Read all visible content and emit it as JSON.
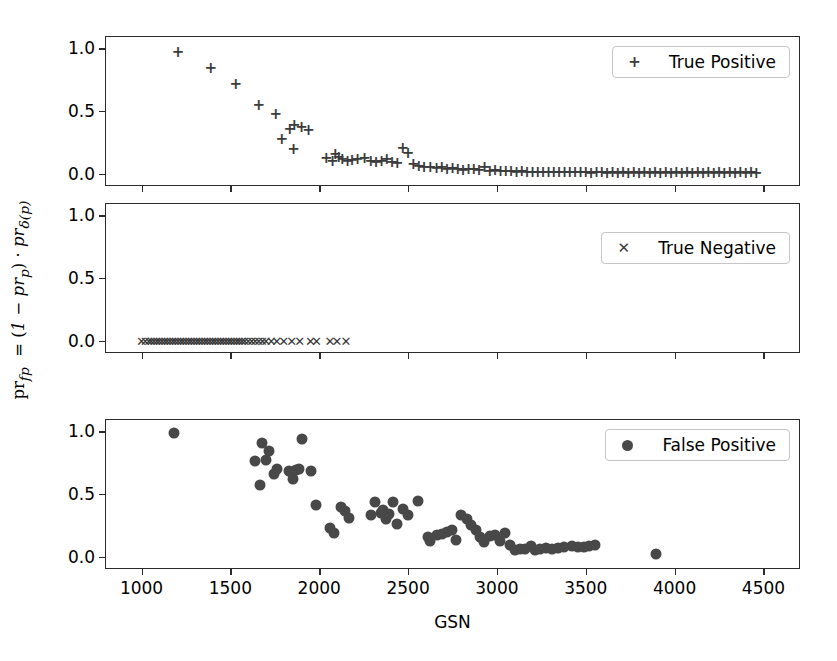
{
  "axis": {
    "xlabel": "GSN",
    "ylabel_html": "pr_fp = (1 − pr_p) · pr_δ(p)",
    "xticks": [
      1000,
      1500,
      2000,
      2500,
      3000,
      3500,
      4000,
      4500
    ],
    "yticks": [
      "0.0",
      "0.5",
      "1.0"
    ],
    "xlim": [
      800,
      4700
    ],
    "ylim": [
      -0.09,
      1.09
    ]
  },
  "legends": [
    {
      "label": "True Positive",
      "marker": "plus-marker",
      "glyph": "+"
    },
    {
      "label": "True Negative",
      "marker": "cross-marker",
      "glyph": "✕"
    },
    {
      "label": "False Positive",
      "marker": "circle-marker",
      "glyph": "●"
    }
  ],
  "colors": {
    "marker": "#3b3b3b",
    "dot": "#484848",
    "axis": "#2b2b2b"
  },
  "chart_data": {
    "type": "scatter",
    "title": "",
    "xlabel": "GSN",
    "ylabel": "pr_fp = (1 - pr_p) . pr_d(p)",
    "xlim": [
      800,
      4700
    ],
    "ylim": [
      -0.09,
      1.09
    ],
    "grid": false,
    "legend_position": "upper right",
    "panels": [
      {
        "name": "true-positive-panel",
        "series_name": "True Positive",
        "marker": "+",
        "x": [
          1205,
          1390,
          1530,
          1660,
          1755,
          1835,
          1860,
          1900,
          1940,
          1790,
          1855,
          2040,
          2075,
          2090,
          2110,
          2130,
          2160,
          2185,
          2215,
          2255,
          2290,
          2320,
          2350,
          2380,
          2410,
          2440,
          2470,
          2500,
          2530,
          2560,
          2590,
          2625,
          2660,
          2690,
          2720,
          2750,
          2780,
          2810,
          2840,
          2870,
          2900,
          2930,
          2960,
          2990,
          3020,
          3050,
          3080,
          3110,
          3140,
          3170,
          3200,
          3230,
          3260,
          3290,
          3320,
          3350,
          3380,
          3410,
          3440,
          3470,
          3500,
          3530,
          3560,
          3590,
          3620,
          3650,
          3680,
          3710,
          3740,
          3770,
          3800,
          3830,
          3860,
          3890,
          3920,
          3950,
          3980,
          4010,
          4040,
          4070,
          4100,
          4130,
          4160,
          4190,
          4220,
          4250,
          4280,
          4310,
          4340,
          4370,
          4400,
          4430,
          4460
        ],
        "y": [
          0.97,
          0.845,
          0.715,
          0.545,
          0.475,
          0.355,
          0.385,
          0.375,
          0.345,
          0.275,
          0.195,
          0.125,
          0.1,
          0.155,
          0.135,
          0.115,
          0.1,
          0.11,
          0.115,
          0.125,
          0.1,
          0.095,
          0.105,
          0.115,
          0.095,
          0.085,
          0.205,
          0.165,
          0.075,
          0.065,
          0.055,
          0.05,
          0.045,
          0.05,
          0.04,
          0.045,
          0.035,
          0.03,
          0.04,
          0.035,
          0.03,
          0.055,
          0.025,
          0.03,
          0.02,
          0.025,
          0.02,
          0.015,
          0.02,
          0.015,
          0.015,
          0.01,
          0.015,
          0.01,
          0.012,
          0.01,
          0.012,
          0.01,
          0.01,
          0.012,
          0.01,
          0.008,
          0.012,
          0.01,
          0.008,
          0.01,
          0.008,
          0.01,
          0.008,
          0.01,
          0.008,
          0.01,
          0.008,
          0.01,
          0.008,
          0.01,
          0.008,
          0.01,
          0.008,
          0.01,
          0.008,
          0.01,
          0.008,
          0.01,
          0.008,
          0.01,
          0.008,
          0.01,
          0.008,
          0.01,
          0.008,
          0.01,
          0.008
        ]
      },
      {
        "name": "true-negative-panel",
        "series_name": "True Negative",
        "marker": "x",
        "x": [
          1000,
          1020,
          1040,
          1055,
          1070,
          1085,
          1100,
          1115,
          1130,
          1145,
          1160,
          1175,
          1190,
          1205,
          1220,
          1235,
          1250,
          1265,
          1280,
          1295,
          1310,
          1325,
          1340,
          1355,
          1370,
          1385,
          1400,
          1415,
          1430,
          1445,
          1460,
          1475,
          1490,
          1505,
          1520,
          1535,
          1550,
          1565,
          1580,
          1600,
          1620,
          1640,
          1660,
          1680,
          1700,
          1730,
          1760,
          1800,
          1845,
          1890,
          1950,
          1985,
          2060,
          2100,
          2150
        ],
        "y": [
          0,
          0,
          0,
          0,
          0,
          0,
          0,
          0,
          0,
          0,
          0,
          0,
          0,
          0,
          0,
          0,
          0,
          0,
          0,
          0,
          0,
          0,
          0,
          0,
          0,
          0,
          0,
          0,
          0,
          0,
          0,
          0,
          0,
          0,
          0,
          0,
          0,
          0,
          0,
          0,
          0,
          0,
          0,
          0,
          0,
          0,
          0,
          0,
          0,
          0,
          0,
          0,
          0,
          0,
          0
        ]
      },
      {
        "name": "false-positive-panel",
        "series_name": "False Positive",
        "marker": "o",
        "x": [
          1180,
          1640,
          1665,
          1680,
          1700,
          1720,
          1745,
          1760,
          1830,
          1850,
          1870,
          1885,
          1905,
          1955,
          1980,
          2060,
          2085,
          2120,
          2145,
          2170,
          2290,
          2315,
          2345,
          2360,
          2375,
          2395,
          2415,
          2440,
          2470,
          2500,
          2555,
          2610,
          2625,
          2660,
          2690,
          2720,
          2745,
          2770,
          2800,
          2830,
          2855,
          2880,
          2905,
          2930,
          2960,
          2990,
          3015,
          3045,
          3075,
          3100,
          3130,
          3160,
          3190,
          3215,
          3245,
          3275,
          3310,
          3345,
          3380,
          3420,
          3455,
          3490,
          3520,
          3550,
          3895
        ],
        "y": [
          0.99,
          0.765,
          0.575,
          0.905,
          0.775,
          0.845,
          0.66,
          0.7,
          0.68,
          0.62,
          0.695,
          0.7,
          0.935,
          0.685,
          0.41,
          0.225,
          0.19,
          0.4,
          0.365,
          0.31,
          0.33,
          0.435,
          0.345,
          0.37,
          0.3,
          0.34,
          0.435,
          0.26,
          0.38,
          0.33,
          0.445,
          0.155,
          0.125,
          0.175,
          0.185,
          0.2,
          0.215,
          0.135,
          0.33,
          0.3,
          0.255,
          0.21,
          0.155,
          0.115,
          0.165,
          0.175,
          0.125,
          0.19,
          0.095,
          0.055,
          0.065,
          0.06,
          0.085,
          0.055,
          0.065,
          0.07,
          0.06,
          0.07,
          0.075,
          0.085,
          0.075,
          0.08,
          0.085,
          0.09,
          0.02
        ]
      }
    ]
  }
}
